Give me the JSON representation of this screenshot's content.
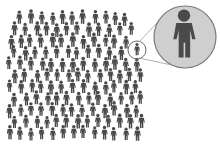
{
  "illustration": {
    "subject": "crowd of people with one person magnified",
    "colors": {
      "background": "#ffffff",
      "person": "#4a4a4a",
      "magnifier_fill": "#cfcfcf",
      "magnifier_stroke": "#7a7a7a",
      "highlight_stroke": "#6a6a6a"
    },
    "crowd": {
      "rows": 11,
      "approx_count": 150
    },
    "highlight": {
      "cx": 137,
      "cy": 50,
      "r": 9
    },
    "magnifier": {
      "cx": 185,
      "cy": 37,
      "r": 31
    }
  }
}
